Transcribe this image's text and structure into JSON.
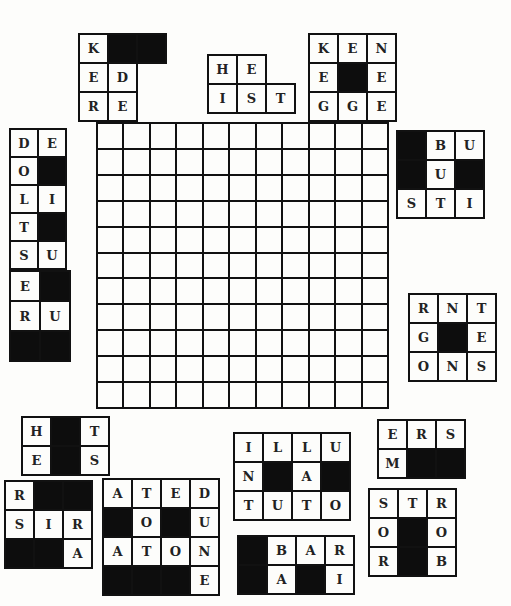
{
  "puzzle": {
    "grid": {
      "rows": 11,
      "cols": 11
    },
    "pieces": [
      {
        "id": "p1",
        "x": 79,
        "y": 34,
        "cell": 27,
        "cols": 3,
        "rows": 3,
        "cells": [
          [
            "K",
            "#",
            "#"
          ],
          [
            "E",
            "D",
            ""
          ],
          [
            "R",
            "E",
            ""
          ]
        ]
      },
      {
        "id": "p2",
        "x": 208,
        "y": 55,
        "cell": 27,
        "cols": 3,
        "rows": 2,
        "cells": [
          [
            "H",
            "E",
            ""
          ],
          [
            "I",
            "S",
            "T"
          ]
        ]
      },
      {
        "id": "p3",
        "x": 308,
        "y": 33,
        "cell": 27,
        "cols": 3,
        "rows": 3,
        "cells": [
          [
            "K",
            "E",
            "N"
          ],
          [
            "E",
            "#",
            "E"
          ],
          [
            "G",
            "G",
            "E"
          ]
        ]
      },
      {
        "id": "p4",
        "x": 9,
        "y": 128,
        "cell": 26,
        "cols": 2,
        "rows": 5,
        "cells": [
          [
            "D",
            "E"
          ],
          [
            "O",
            "#"
          ],
          [
            "L",
            "I"
          ],
          [
            "T",
            "#"
          ],
          [
            "S",
            "U"
          ]
        ]
      },
      {
        "id": "p5",
        "x": 396,
        "y": 130,
        "cell": 27,
        "cols": 3,
        "rows": 3,
        "cells": [
          [
            "#",
            "B",
            "U"
          ],
          [
            "#",
            "U",
            "#"
          ],
          [
            "S",
            "T",
            "I"
          ]
        ]
      },
      {
        "id": "p6",
        "x": 9,
        "y": 270,
        "cell": 28,
        "cols": 2,
        "rows": 3,
        "cells": [
          [
            "E",
            "#"
          ],
          [
            "R",
            "U"
          ],
          [
            "#",
            "#"
          ]
        ]
      },
      {
        "id": "p7",
        "x": 408,
        "y": 293,
        "cell": 27,
        "cols": 3,
        "rows": 3,
        "cells": [
          [
            "R",
            "N",
            "T"
          ],
          [
            "G",
            "#",
            "E"
          ],
          [
            "O",
            "N",
            "S"
          ]
        ]
      },
      {
        "id": "p8",
        "x": 21,
        "y": 416,
        "cell": 27,
        "cols": 3,
        "rows": 2,
        "cells": [
          [
            "H",
            "#",
            "T"
          ],
          [
            "E",
            "#",
            "S"
          ]
        ]
      },
      {
        "id": "p9",
        "x": 233,
        "y": 432,
        "cell": 27,
        "cols": 4,
        "rows": 3,
        "cells": [
          [
            "I",
            "L",
            "L",
            "U"
          ],
          [
            "N",
            "#",
            "A",
            "#"
          ],
          [
            "T",
            "U",
            "T",
            "O"
          ]
        ]
      },
      {
        "id": "p10",
        "x": 377,
        "y": 419,
        "cell": 27,
        "cols": 3,
        "rows": 2,
        "cells": [
          [
            "E",
            "R",
            "S"
          ],
          [
            "M",
            "#",
            "#"
          ]
        ]
      },
      {
        "id": "p11",
        "x": 4,
        "y": 480,
        "cell": 27,
        "cols": 3,
        "rows": 3,
        "cells": [
          [
            "R",
            "#",
            "#"
          ],
          [
            "S",
            "I",
            "R"
          ],
          [
            "#",
            "#",
            "A"
          ]
        ]
      },
      {
        "id": "p12",
        "x": 102,
        "y": 478,
        "cell": 27,
        "cols": 4,
        "rows": 4,
        "cells": [
          [
            "A",
            "T",
            "E",
            "D"
          ],
          [
            "#",
            "O",
            "#",
            "U"
          ],
          [
            "A",
            "T",
            "O",
            "N"
          ],
          [
            "#",
            "#",
            "#",
            "E"
          ]
        ]
      },
      {
        "id": "p13",
        "x": 237,
        "y": 535,
        "cell": 27,
        "cols": 4,
        "rows": 2,
        "cells": [
          [
            "#",
            "B",
            "A",
            "R"
          ],
          [
            "#",
            "A",
            "#",
            "I"
          ]
        ]
      },
      {
        "id": "p14",
        "x": 368,
        "y": 488,
        "cell": 27,
        "cols": 3,
        "rows": 3,
        "cells": [
          [
            "S",
            "T",
            "R"
          ],
          [
            "O",
            "#",
            "O"
          ],
          [
            "R",
            "#",
            "B"
          ]
        ]
      }
    ]
  }
}
